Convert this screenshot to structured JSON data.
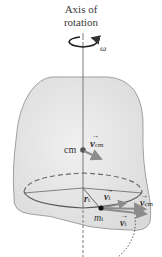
{
  "title": {
    "line1": "Axis of",
    "line2": "rotation"
  },
  "labels": {
    "omega": "ω",
    "cm": "cm",
    "v_cm_center": "v",
    "v_cm_center_sub": "cm",
    "r_i": "r",
    "r_i_sub": "i",
    "v_i_prime": "v",
    "v_i_prime_sub": "i",
    "v_i_prime_mark": "′",
    "v_cm_particle": "v",
    "v_cm_particle_sub": "cm",
    "m_i": "m",
    "m_i_sub": "i",
    "v_i": "v",
    "v_i_sub": "i"
  },
  "colors": {
    "body_fill": "#e6e6e6",
    "body_stroke": "#9a9a9a",
    "axis": "#7a7a7a",
    "dashed_orbit": "#6a6a6a",
    "vector": "#8c8c8c",
    "point": "#1a1a1a",
    "text": "#333333"
  }
}
